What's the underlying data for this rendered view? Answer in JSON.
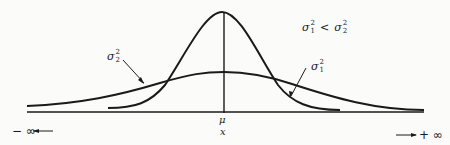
{
  "diagram": {
    "relation": {
      "left": "σ",
      "left_sup": "2",
      "left_sub": "1",
      "op": "<",
      "right": "σ",
      "right_sup": "2",
      "right_sub": "2"
    },
    "curve_narrow_label": {
      "sym": "σ",
      "sup": "2",
      "sub": "1"
    },
    "curve_wide_label": {
      "sym": "σ",
      "sup": "2",
      "sub": "2"
    },
    "mean_label": "μ",
    "axis_label": "x",
    "left_infinity": "− ∞",
    "right_infinity": "+ ∞",
    "line_color": "#1a1a1a",
    "background": "#fbfbfa"
  }
}
